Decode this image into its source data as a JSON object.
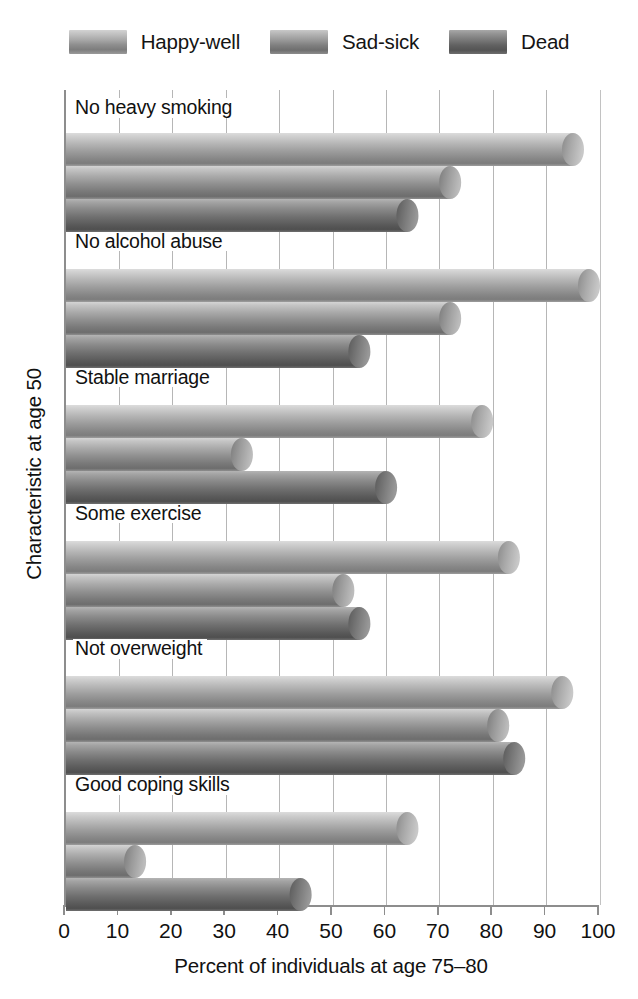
{
  "chart_data": {
    "type": "bar",
    "orientation": "horizontal",
    "title": "",
    "xlabel": "Percent of individuals at age 75–80",
    "ylabel": "Characteristic at age 50",
    "xlim": [
      0,
      100
    ],
    "xticks": [
      0,
      10,
      20,
      30,
      40,
      50,
      60,
      70,
      80,
      90,
      100
    ],
    "xtick_labels": [
      "0",
      "10",
      "20",
      "30",
      "40",
      "50",
      "60",
      "70",
      "80",
      "90",
      "100"
    ],
    "grid": "vertical",
    "legend_position": "top-center",
    "categories": [
      "No heavy smoking",
      "No alcohol abuse",
      "Stable marriage",
      "Some exercise",
      "Not overweight",
      "Good coping skills"
    ],
    "series": [
      {
        "name": "Happy-well",
        "color": "#a0a0a0",
        "values": [
          97,
          100,
          80,
          85,
          95,
          66
        ]
      },
      {
        "name": "Sad-sick",
        "color": "#8f8f8f",
        "values": [
          74,
          74,
          35,
          54,
          83,
          15
        ]
      },
      {
        "name": "Dead",
        "color": "#6d6d6d",
        "values": [
          66,
          57,
          62,
          57,
          86,
          46
        ]
      }
    ]
  },
  "legend": {
    "items": [
      {
        "label": "Happy-well"
      },
      {
        "label": "Sad-sick"
      },
      {
        "label": "Dead"
      }
    ]
  },
  "axes": {
    "x_title": "Percent of individuals at age 75–80",
    "y_title": "Characteristic at age 50"
  }
}
